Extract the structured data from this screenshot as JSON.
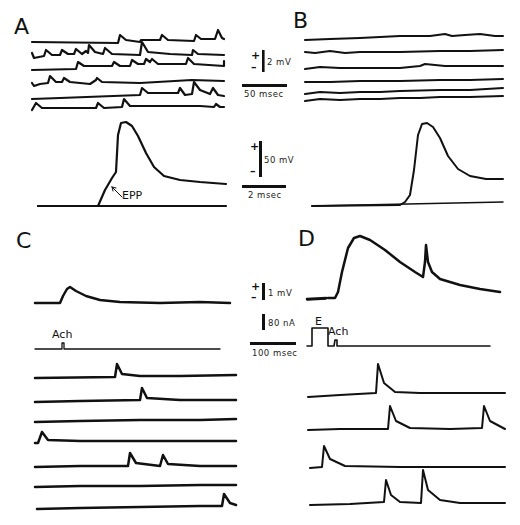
{
  "figure": {
    "panels": [
      {
        "id": "A",
        "label": "A",
        "description": "Spontaneous miniature potentials (6 sweeps) and evoked action potential with EPP foot"
      },
      {
        "id": "B",
        "label": "B",
        "description": "Flat baseline sweeps (6) and evoked action potential"
      },
      {
        "id": "C",
        "label": "C",
        "description": "Ach-evoked potential with Ach pulse marker and 7 spontaneous sweeps"
      },
      {
        "id": "D",
        "label": "D",
        "description": "Ach response after electrical stimulation E, and 4 spontaneous sweeps"
      }
    ],
    "scale_bars": {
      "top": {
        "voltage": "2 mV",
        "time": "50 msec",
        "plus": "+",
        "minus": "–"
      },
      "middle": {
        "voltage": "50 mV",
        "time": "2 msec",
        "plus": "+",
        "minus": "–"
      },
      "bottom": {
        "voltage": "1 mV",
        "current": "80 nA",
        "time": "100 msec",
        "plus": "+",
        "minus": "–"
      }
    },
    "annotations": {
      "epp": "EPP",
      "ach_c": "Ach",
      "ach_d": "Ach",
      "e_d": "E"
    }
  }
}
